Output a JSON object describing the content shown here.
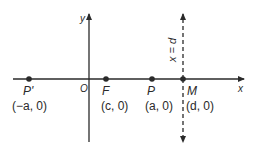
{
  "diagram": {
    "axes": {
      "x_label": "x",
      "y_label": "y",
      "origin_label": "O"
    },
    "points": [
      {
        "name": "P'",
        "coord": "(−a, 0)",
        "x": 29
      },
      {
        "name": "F",
        "coord": "(c, 0)",
        "x": 106
      },
      {
        "name": "P",
        "coord": "(a, 0)",
        "x": 152
      },
      {
        "name": "M",
        "coord": "(d, 0)",
        "x": 183
      }
    ],
    "directrix": {
      "label": "x = d",
      "style": "dashed"
    },
    "colors": {
      "line": "#2a2a2a",
      "background": "#ffffff"
    }
  }
}
